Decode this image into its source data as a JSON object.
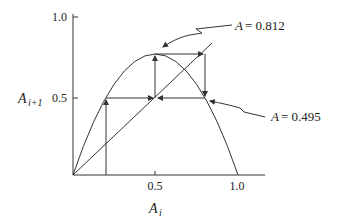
{
  "diagram": {
    "type": "cobweb-plot",
    "axes": {
      "x_label": "A",
      "x_label_sub": "i",
      "y_label": "A",
      "y_label_sub": "i+1",
      "x_ticks": [
        "0.5",
        "1.0"
      ],
      "y_ticks": [
        "1.0",
        "0.5"
      ]
    },
    "annotations": [
      {
        "prefix": "A",
        "text": "= 0.812"
      },
      {
        "prefix": "A",
        "text": "= 0.495"
      }
    ],
    "colors": {
      "line": "#333333",
      "text": "#222222",
      "background": "#ffffff"
    }
  }
}
